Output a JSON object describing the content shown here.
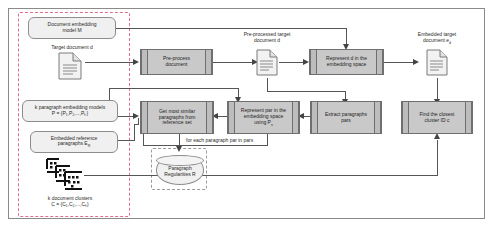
{
  "diagram": {
    "regions": {
      "inputs_region": "inputs-dashed-region",
      "regularities_region": "regularities-dashed-region",
      "outer_frame": "process-outer-frame"
    },
    "colors": {
      "dashed_pink": "#e06d8a",
      "dashed_gray": "#9a9a9a",
      "process_fill": "#c9c9c9",
      "data_fill": "#f0f0f0",
      "line": "#555555",
      "frame": "#8a8a8a"
    },
    "inputs": [
      {
        "id": "document-embedding-model",
        "label": "Document embedding model M",
        "line1": "Document embedding",
        "line2": "model M",
        "shape": "rounded-box"
      },
      {
        "id": "paragraph-embedding-models",
        "label": "k paragraph embedding models P = {P1,P2,...,Pk}",
        "line1": "k paragraph embedding models",
        "line2": "P = {P₁,P₂,...,Pₖ}",
        "shape": "rounded-box"
      },
      {
        "id": "embedded-reference-paragraphs",
        "label": "Embedded reference paragraphs ER",
        "line1": "Embedded reference",
        "line2": "paragraphs E",
        "sub": "R",
        "shape": "rounded-box"
      }
    ],
    "artifacts": [
      {
        "id": "target-document",
        "caption": "Target document d",
        "icon": "document-icon"
      },
      {
        "id": "preprocessed-target-document",
        "caption_line1": "Pre-processed target",
        "caption_line2": "document d",
        "icon": "document-icon"
      },
      {
        "id": "embedded-target-document",
        "caption_line1": "Embedded target",
        "caption_line2": "document e",
        "caption_sub": "d",
        "icon": "document-icon"
      },
      {
        "id": "document-clusters",
        "caption_line1": "k document clusters",
        "caption_line2": "C = {C₁,C₂,...,Cₖ}",
        "icon": "clusters-icon"
      }
    ],
    "processes": [
      {
        "id": "pre-process-document",
        "line1": "Pre-process",
        "line2": "document",
        "line3": ""
      },
      {
        "id": "represent-d-embedding-space",
        "line1": "Represent d in the",
        "line2": "embedding space",
        "line3": ""
      },
      {
        "id": "get-most-similar-paragraphs",
        "line1": "Get most similar",
        "line2": "paragraphs from",
        "line3": "reference set"
      },
      {
        "id": "represent-par-embedding-space",
        "line1": "Represent par in the",
        "line2": "embedding space",
        "line3": "using P"
      },
      {
        "id": "extract-paragraphs",
        "line1": "Extract paragraphs",
        "line2": "pars",
        "line3": ""
      },
      {
        "id": "find-closest-cluster",
        "line1": "Find the closest",
        "line2": "cluster ID c",
        "line3": ""
      }
    ],
    "store": {
      "id": "paragraph-regularities",
      "line1": "Paragraph",
      "line2": "Regularities R"
    },
    "annotations": [
      {
        "id": "loop-annotation",
        "text": "for each paragraph par in pars"
      }
    ],
    "subscripts": {
      "represent_par_sub": "s"
    }
  }
}
